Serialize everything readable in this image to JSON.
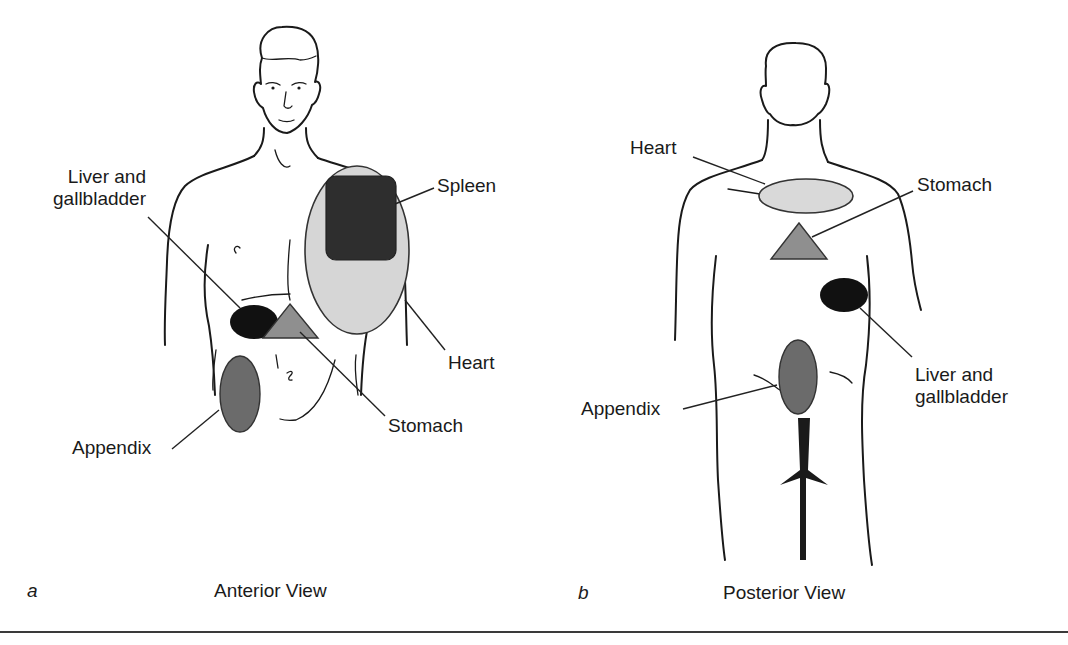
{
  "figure": {
    "panels": [
      {
        "letter": "a",
        "caption": "Anterior View",
        "labels": {
          "liver_line1": "Liver and",
          "liver_line2": "gallbladder",
          "spleen": "Spleen",
          "heart": "Heart",
          "stomach": "Stomach",
          "appendix": "Appendix"
        }
      },
      {
        "letter": "b",
        "caption": "Posterior View",
        "labels": {
          "heart": "Heart",
          "stomach": "Stomach",
          "liver_line1": "Liver and",
          "liver_line2": "gallbladder",
          "appendix": "Appendix"
        }
      }
    ],
    "organ_colors": {
      "liver": "#111111",
      "spleen": "#2e2e2e",
      "heart": "#d9d9d9",
      "stomach": "#8f8f8f",
      "appendix": "#6b6b6b"
    }
  }
}
